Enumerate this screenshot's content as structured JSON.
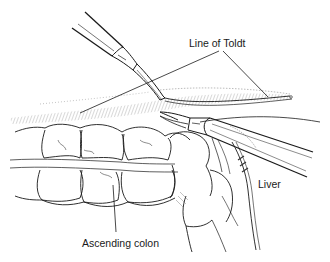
{
  "figure": {
    "type": "surgical line illustration",
    "labels": {
      "line_of_toldt": "Line of Toldt",
      "liver": "Liver",
      "ascending_colon": "Ascending colon"
    },
    "elements": [
      "upper-grasper-instrument",
      "lower-dissector-instrument",
      "peritoneal-reflection",
      "ascending-colon-haustra",
      "hepatic-flexure",
      "liver-edge"
    ],
    "colors": {
      "ink": "#1a1a1a",
      "hatch": "#555555",
      "background": "#ffffff"
    }
  }
}
